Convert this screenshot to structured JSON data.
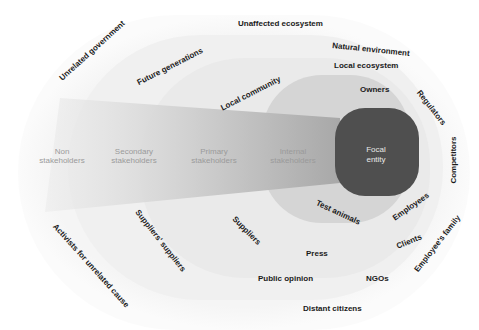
{
  "diagram": {
    "type": "stakeholder-map",
    "colors": {
      "background": "#ffffff",
      "ring_outer": "#f7f7f7",
      "ring_secondary": "#f1f1f1",
      "ring_primary": "#ebebeb",
      "ring_internal": "#d6d6d6",
      "focal_entity": "#4f4f4f",
      "wedge": "#bdbdbd",
      "zone_text": "#9a9a9a",
      "label_text": "#1a1a1a",
      "focal_text": "#e8e8e8"
    },
    "focal": {
      "line1": "Focal",
      "line2": "entity"
    },
    "zones": [
      {
        "line1": "Non",
        "line2": "stakeholders"
      },
      {
        "line1": "Secondary",
        "line2": "stakeholders"
      },
      {
        "line1": "Primary",
        "line2": "stakeholders"
      },
      {
        "line1": "Internal",
        "line2": "stakeholders"
      }
    ],
    "labels": {
      "unaffected_ecosystem": "Unaffected ecosystem",
      "unrelated_government": "Unrelated government",
      "natural_environment": "Natural environment",
      "future_generations": "Future generations",
      "local_ecosystem": "Local ecosystem",
      "local_community": "Local community",
      "owners": "Owners",
      "regulators": "Regulators",
      "competitors": "Competitors",
      "employees": "Employees",
      "test_animals": "Test animals",
      "suppliers": "Suppliers",
      "suppliers_suppliers": "Suppliers' suppliers",
      "activists": "Activists for unrelated cause",
      "clients": "Clients",
      "employees_family": "Employee's family",
      "press": "Press",
      "public_opinion": "Public opinion",
      "ngos": "NGOs",
      "distant_citizens": "Distant citizens"
    }
  }
}
